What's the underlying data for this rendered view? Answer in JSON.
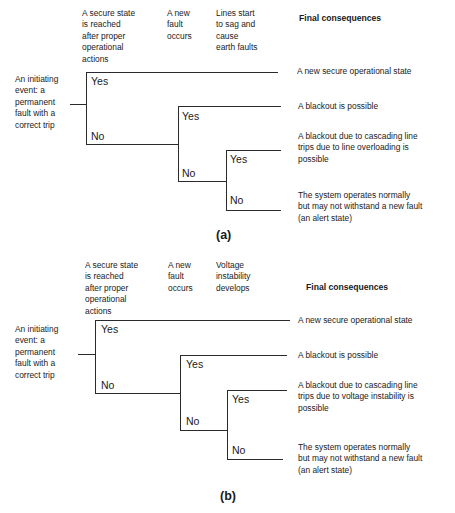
{
  "panel_a": {
    "caption": "(a)",
    "columns": [
      "A secure state\nis reached\nafter proper\noperational\nactions",
      "A new\nfault\noccurs",
      "Lines start\nto sag and\ncause\nearth faults"
    ],
    "consequences_header": "Final consequences",
    "initiating_event": "An initiating\nevent: a\npermanent\nfault with a\ncorrect trip",
    "branches": {
      "yes": "Yes",
      "no": "No"
    },
    "outcomes": [
      "A new secure operational state",
      "A blackout is possible",
      "A blackout due to cascading line\ntrips due to line overloading  is\npossible",
      "The system operates normally\nbut may not withstand a new fault\n(an alert state)"
    ]
  },
  "panel_b": {
    "caption": "(b)",
    "columns": [
      "A secure state\nis reached\nafter proper\noperational\nactions",
      "A new\nfault\noccurs",
      "Voltage\ninstability\ndevelops"
    ],
    "consequences_header": "Final consequences",
    "initiating_event": "An initiating\nevent: a\npermanent\nfault with a\ncorrect trip",
    "branches": {
      "yes": "Yes",
      "no": "No"
    },
    "outcomes": [
      "A new secure operational state",
      "A blackout is possible",
      "A blackout due to cascading line\ntrips due to voltage instability is\npossible",
      "The system operates normally\nbut may not withstand a new fault\n(an alert state)"
    ]
  }
}
